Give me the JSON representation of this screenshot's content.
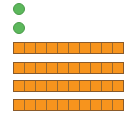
{
  "diagram": {
    "title": "",
    "representation": "base-ten blocks",
    "colors": {
      "ones": "#5cb85c",
      "tens": "#f7941d",
      "tens_border": "#8a5a2a"
    },
    "ones": [
      {
        "cx": 19,
        "cy": 9
      },
      {
        "cx": 19,
        "cy": 28
      }
    ],
    "tens": [
      {
        "top": 42,
        "units": 10
      },
      {
        "top": 62,
        "units": 10
      },
      {
        "top": 80,
        "units": 10
      },
      {
        "top": 99,
        "units": 10
      }
    ],
    "counts": {
      "ones": 2,
      "tens": 4,
      "value": 42
    }
  }
}
